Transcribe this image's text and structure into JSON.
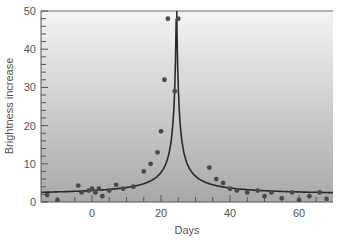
{
  "chart_data": {
    "type": "scatter",
    "title": "",
    "xlabel": "Days",
    "ylabel": "Brightness increase",
    "xlim": [
      -15,
      70
    ],
    "ylim": [
      0,
      50
    ],
    "x_ticks": [
      0,
      20,
      40,
      60
    ],
    "y_ticks": [
      0,
      10,
      20,
      30,
      40,
      50
    ],
    "grid": false,
    "legend": null,
    "series": [
      {
        "name": "Observed brightness",
        "type": "scatter",
        "x": [
          -13,
          -10,
          -4,
          -3,
          -1,
          0,
          1,
          2,
          3,
          5,
          7,
          9,
          12,
          15,
          17,
          19,
          20,
          21,
          22,
          24,
          25,
          34,
          36,
          38,
          40,
          42,
          45,
          48,
          50,
          52,
          55,
          58,
          60,
          63,
          66,
          68
        ],
        "y": [
          1.8,
          0.5,
          4.3,
          2.5,
          3.0,
          3.5,
          2.5,
          3.5,
          1.5,
          3.0,
          4.5,
          3.5,
          4.0,
          8.0,
          10.0,
          13.0,
          18.5,
          32.0,
          48.0,
          29.0,
          48.0,
          9.0,
          6.0,
          5.0,
          3.5,
          3.0,
          2.5,
          3.0,
          1.5,
          2.5,
          1.0,
          2.5,
          0.5,
          1.5,
          2.5,
          0.8
        ]
      },
      {
        "name": "Fitted curve",
        "type": "line",
        "peak_day": 24.5,
        "baseline": 1.8,
        "description": "Symmetric cusp peaking near day 24.5, rising off the top of the axis"
      }
    ]
  },
  "axes": {
    "x_label": "Days",
    "y_label": "Brightness increase",
    "x_tick_labels": [
      "0",
      "20",
      "40",
      "60"
    ],
    "y_tick_labels": [
      "0",
      "10",
      "20",
      "30",
      "40",
      "50"
    ]
  },
  "colors": {
    "plot_bg_top": "#f2f2f2",
    "plot_bg_bottom": "#a9a9a9",
    "curve": "#2a2a2a",
    "points": "#4a4a4a",
    "axis": "#555555",
    "text": "#555555"
  }
}
